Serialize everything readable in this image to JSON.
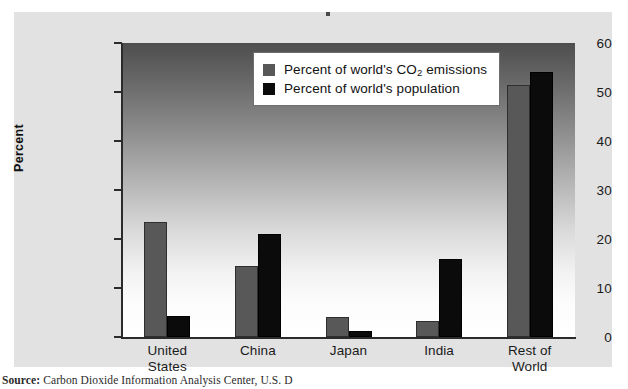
{
  "figure": {
    "source_prefix": "Source:",
    "source_text": "Carbon Dioxide Information Analysis Center, U.S. D"
  },
  "chart_data": {
    "type": "bar",
    "title": "",
    "xlabel": "",
    "ylabel": "Percent",
    "ylim": [
      0,
      60
    ],
    "yticks": [
      0,
      10,
      20,
      30,
      40,
      50,
      60
    ],
    "ytick_labels": [
      "0",
      "10",
      "20",
      "30",
      "40",
      "50",
      "60"
    ],
    "grid": false,
    "legend_position": "upper center",
    "categories": [
      "United States",
      "China",
      "Japan",
      "India",
      "Rest of World"
    ],
    "category_lines": [
      [
        "United",
        "States"
      ],
      [
        "China"
      ],
      [
        "Japan"
      ],
      [
        "India"
      ],
      [
        "Rest of",
        "World"
      ]
    ],
    "series": [
      {
        "name": "Percent of world's CO2 emissions",
        "label_prefix": "Percent of world's CO",
        "label_sub": "2",
        "label_suffix": " emissions",
        "color": "#585858",
        "values": [
          23.5,
          14.5,
          4.0,
          3.3,
          51.5
        ]
      },
      {
        "name": "Percent of world's population",
        "label_prefix": "Percent of world's population",
        "label_sub": "",
        "label_suffix": "",
        "color": "#0b0b0b",
        "values": [
          4.2,
          21.0,
          1.3,
          16.0,
          54.0
        ]
      }
    ]
  }
}
